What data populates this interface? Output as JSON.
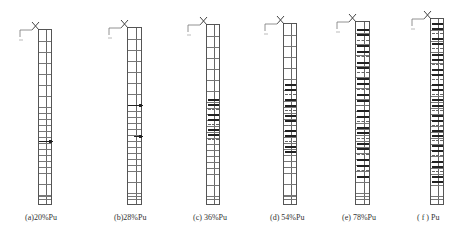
{
  "figure": {
    "panels": [
      {
        "id": "a",
        "caption": "(a)20%Pu",
        "load_fraction": "20%",
        "x": 38,
        "top": 29,
        "width": 14,
        "bottom": 205,
        "cracks": [
          {
            "y": 140,
            "x1": 0,
            "x2": 14,
            "dense": false
          }
        ]
      },
      {
        "id": "b",
        "caption": "(b)28%Pu",
        "load_fraction": "28%",
        "x": 127,
        "top": 27,
        "width": 15,
        "bottom": 205,
        "cracks": [
          {
            "y": 104,
            "x1": 0,
            "x2": 15,
            "dense": false
          },
          {
            "y": 135,
            "x1": 6,
            "x2": 15,
            "dense": false
          }
        ]
      },
      {
        "id": "c",
        "caption": "(c) 36%Pu",
        "load_fraction": "36%",
        "x": 206,
        "top": 24,
        "width": 14,
        "bottom": 205,
        "crack_zone": {
          "y_start": 98,
          "y_end": 143,
          "rows": 9
        }
      },
      {
        "id": "d",
        "caption": "(d) 54%Pu",
        "load_fraction": "54%",
        "x": 283,
        "top": 23,
        "width": 14,
        "bottom": 205,
        "crack_zone": {
          "y_start": 83,
          "y_end": 155,
          "rows": 14
        }
      },
      {
        "id": "e",
        "caption": "(e) 78%Pu",
        "load_fraction": "78%",
        "x": 355,
        "top": 21,
        "width": 15,
        "bottom": 205,
        "crack_zone": {
          "y_start": 28,
          "y_end": 180,
          "rows": 28
        }
      },
      {
        "id": "f",
        "caption": "( f ) Pu",
        "load_fraction": "100%",
        "x": 430,
        "top": 18,
        "width": 14,
        "bottom": 205,
        "crack_zone": {
          "y_start": 22,
          "y_end": 185,
          "rows": 32
        }
      }
    ],
    "colors": {
      "line": "#555555",
      "crack": "#222222",
      "caption": "#333333"
    }
  }
}
